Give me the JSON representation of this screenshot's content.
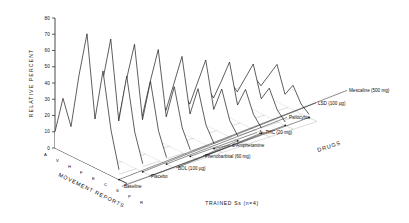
{
  "figure": {
    "footer": "TRAINED Ss (n=4)"
  },
  "chart_data": {
    "type": "line",
    "title": "",
    "subtitle": "",
    "ylabel": "RELATIVE PERCENT",
    "xlabel": "MOVEMENT REPORTS",
    "zlabel": "DRUGS",
    "ylim": [
      0,
      80
    ],
    "yticks": [
      0,
      10,
      20,
      30,
      40,
      50,
      60,
      70,
      80
    ],
    "grid": true,
    "legend": "right-inline-labels",
    "categories": [
      "A",
      "V",
      "H",
      "F",
      "E",
      "C",
      "S",
      "P",
      "R"
    ],
    "category_labels": [
      "A",
      "V",
      "H",
      "F",
      "E",
      "C",
      "S",
      "P",
      "R"
    ],
    "series": [
      {
        "name": "Mescaline (500 mg)",
        "values": [
          10,
          33,
          18,
          52,
          80,
          30,
          62,
          28,
          6
        ]
      },
      {
        "name": "LSD (100 µg)",
        "values": [
          8,
          28,
          14,
          44,
          72,
          24,
          54,
          22,
          5
        ]
      },
      {
        "name": "Psilocybin",
        "values": [
          7,
          24,
          12,
          40,
          64,
          20,
          46,
          18,
          4
        ]
      },
      {
        "name": "Δ⁹-THC (20 mg)",
        "values": [
          6,
          20,
          10,
          34,
          56,
          17,
          38,
          15,
          4
        ]
      },
      {
        "name": "d-Amphetamine",
        "values": [
          5,
          17,
          9,
          28,
          47,
          14,
          32,
          12,
          3
        ]
      },
      {
        "name": "Phenobarbital (60 mg)",
        "values": [
          5,
          15,
          8,
          24,
          40,
          12,
          27,
          10,
          3
        ]
      },
      {
        "name": "BOL (100 µg)",
        "values": [
          4,
          13,
          7,
          20,
          34,
          10,
          22,
          9,
          3
        ]
      },
      {
        "name": "Placebo",
        "values": [
          4,
          11,
          6,
          17,
          28,
          9,
          18,
          7,
          2
        ]
      },
      {
        "name": "Baseline",
        "values": [
          3,
          9,
          5,
          14,
          23,
          7,
          15,
          6,
          2
        ]
      }
    ]
  }
}
